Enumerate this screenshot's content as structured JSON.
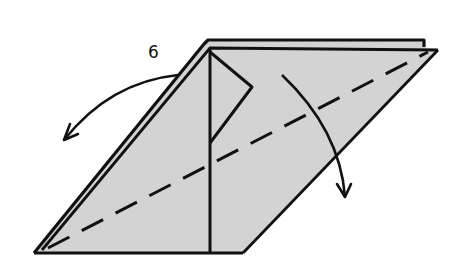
{
  "diagram": {
    "type": "origami-fold-instruction",
    "step_number": "6",
    "colors": {
      "paper_fill": "#d3d3d3",
      "line": "#111111",
      "background": "#ffffff"
    },
    "elements": [
      {
        "name": "paper-parallelogram",
        "description": "gray folded paper shape"
      },
      {
        "name": "valley-fold-line",
        "description": "dashed diagonal from bottom-left to top-right corner"
      },
      {
        "name": "center-vertical-crease",
        "description": "vertical line at center"
      },
      {
        "name": "inner-flap",
        "description": "triangular inner flap near top center"
      },
      {
        "name": "left-fold-arrow",
        "description": "curved arrow from top edge pointing down-left"
      },
      {
        "name": "right-fold-arrow",
        "description": "curved arrow pointing downward over right edge"
      }
    ]
  }
}
